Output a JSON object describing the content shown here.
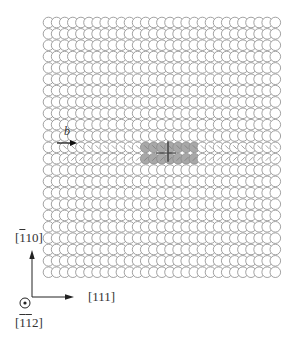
{
  "figure": {
    "lattice": {
      "rows": 23,
      "cols": 29,
      "origin_x": 48.5,
      "origin_y": 22.5,
      "col_spacing": 8.1,
      "row_spacing": 11.35,
      "radius": 5.3,
      "row_offset": 0,
      "stroke_color": "#8a8a8a",
      "fill_color": "#ffffff"
    },
    "dislocation": {
      "rows": [
        11,
        12
      ],
      "x_start": 140,
      "x_end": 196,
      "shade_color": "#a8a8a8",
      "core_x": 168,
      "core_color": "#4a4a4a",
      "distorted_rows": [
        11,
        12
      ]
    },
    "burgers_vector": {
      "label": "b",
      "arrow_from": [
        57,
        143
      ],
      "arrow_to": [
        77,
        143
      ]
    },
    "axes": {
      "vertical_label": "[̅1̅10]",
      "vertical_label_parts": {
        "bar": "1",
        "rest": "10"
      },
      "horizontal_label": "[111]",
      "out_of_plane_label_parts": {
        "bar1": "1",
        "bar2": "1",
        "rest": "2"
      },
      "out_of_plane_symbol": "circle-dot",
      "line_color": "#222222"
    }
  }
}
